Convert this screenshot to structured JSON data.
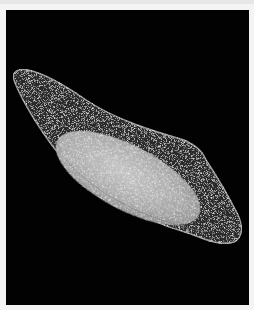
{
  "image": {
    "subject": "darkfield micrograph of elongated seed with inner bright embryo",
    "background_color": "#020202",
    "frame_color": "#f4f4f4",
    "shell_color": "#2a2a2a",
    "shell_edge_color": "#9a9a9a",
    "core_color": "#b8b8b8"
  }
}
